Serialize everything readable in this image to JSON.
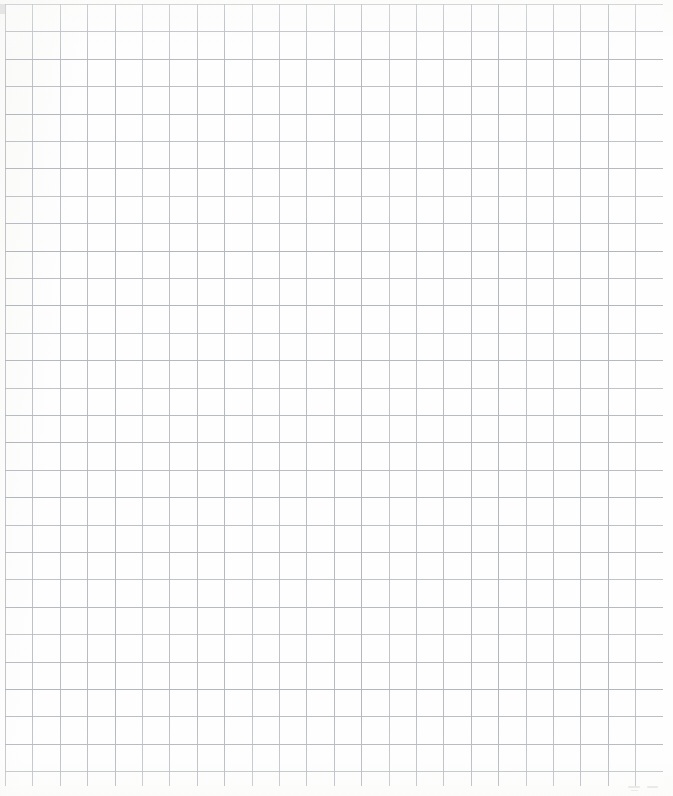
{
  "document": {
    "kind": "graph-paper-scan",
    "description": "Scanned sheet of blank quadrille graph paper",
    "page_width_px": 673,
    "page_height_px": 796,
    "background_color": "#fefefe",
    "has_text": false,
    "caption": ""
  },
  "grid": {
    "line_color": "#b2b6bd",
    "line_width_px": 1,
    "cell_size_px": 27.4,
    "origin_x_px": 5,
    "origin_y_px": 4,
    "columns": 24,
    "rows": 28,
    "right_edge_px": 663,
    "bottom_edge_px": 786,
    "uniform": true,
    "major_gridlines": false
  },
  "artifacts": {
    "label": "faint scan marks below grid, bottom-right",
    "color": "#d8d8d6",
    "marks": [
      {
        "x": 628,
        "y": 786,
        "w": 12,
        "h": 2
      },
      {
        "x": 647,
        "y": 786,
        "w": 11,
        "h": 2
      },
      {
        "x": 631,
        "y": 790,
        "w": 7,
        "h": 1
      }
    ]
  },
  "chart_data": {
    "type": "table",
    "title": "",
    "xlabel": "",
    "ylabel": "",
    "categories": [],
    "values": [],
    "series": [],
    "grid": true,
    "legend": "none",
    "note": "Blank graph paper — no plotted data, only ruled gridlines."
  }
}
